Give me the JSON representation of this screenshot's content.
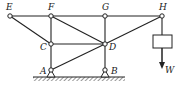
{
  "diagram": {
    "type": "truss",
    "colors": {
      "line": "#222222",
      "background": "#ffffff"
    },
    "nodes": [
      {
        "id": "E",
        "label": "E",
        "x": 10,
        "y": 16
      },
      {
        "id": "F",
        "label": "F",
        "x": 51,
        "y": 16
      },
      {
        "id": "G",
        "label": "G",
        "x": 105,
        "y": 16
      },
      {
        "id": "H",
        "label": "H",
        "x": 162,
        "y": 16
      },
      {
        "id": "C",
        "label": "C",
        "x": 51,
        "y": 44
      },
      {
        "id": "D",
        "label": "D",
        "x": 105,
        "y": 44
      },
      {
        "id": "A",
        "label": "A",
        "x": 51,
        "y": 70
      },
      {
        "id": "B",
        "label": "B",
        "x": 105,
        "y": 70
      }
    ],
    "members": [
      [
        "E",
        "F"
      ],
      [
        "F",
        "G"
      ],
      [
        "G",
        "H"
      ],
      [
        "E",
        "C"
      ],
      [
        "F",
        "C"
      ],
      [
        "F",
        "D"
      ],
      [
        "C",
        "D"
      ],
      [
        "G",
        "D"
      ],
      [
        "H",
        "D"
      ],
      [
        "A",
        "C"
      ],
      [
        "A",
        "D"
      ],
      [
        "B",
        "D"
      ]
    ],
    "supports": [
      {
        "node": "A",
        "type": "pin"
      },
      {
        "node": "B",
        "type": "pin"
      }
    ],
    "load": {
      "node": "H",
      "label": "W",
      "direction": "down"
    }
  }
}
